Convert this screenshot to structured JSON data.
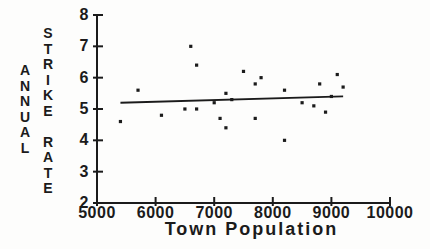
{
  "figure": {
    "background": "#fdfdfc",
    "ink_color": "#1b1b1b"
  },
  "chart_data": {
    "type": "scatter",
    "title": "",
    "xlabel": "Town Population",
    "ylabel": "ANNUAL STRIKE RATE",
    "ylabel_columns": [
      "ANNUAL",
      "STRIKE RATE"
    ],
    "xlim": [
      5000,
      10000
    ],
    "ylim": [
      2,
      8
    ],
    "xticks": [
      5000,
      6000,
      7000,
      8000,
      9000,
      10000
    ],
    "yticks": [
      2,
      3,
      4,
      5,
      6,
      7,
      8
    ],
    "grid": false,
    "legend": null,
    "marker": "square",
    "marker_color": "#1b1b1b",
    "points": [
      [
        5400,
        4.6
      ],
      [
        5700,
        5.6
      ],
      [
        6100,
        4.8
      ],
      [
        6500,
        5.0
      ],
      [
        6600,
        7.0
      ],
      [
        6700,
        6.4
      ],
      [
        6700,
        5.0
      ],
      [
        7000,
        5.2
      ],
      [
        7100,
        4.7
      ],
      [
        7200,
        4.4
      ],
      [
        7200,
        5.5
      ],
      [
        7300,
        5.3
      ],
      [
        7500,
        6.2
      ],
      [
        7700,
        4.7
      ],
      [
        7700,
        5.8
      ],
      [
        7800,
        6.0
      ],
      [
        8200,
        4.0
      ],
      [
        8200,
        5.6
      ],
      [
        8500,
        5.2
      ],
      [
        8700,
        5.1
      ],
      [
        8800,
        5.8
      ],
      [
        8900,
        4.9
      ],
      [
        9000,
        5.4
      ],
      [
        9100,
        6.1
      ],
      [
        9200,
        5.7
      ]
    ],
    "trendline": {
      "x1": 5400,
      "y1": 5.2,
      "x2": 9200,
      "y2": 5.4
    }
  }
}
